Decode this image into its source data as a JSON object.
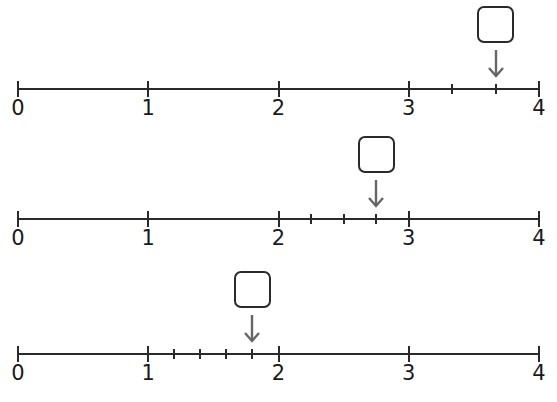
{
  "number_lines": [
    {
      "axis_y": 89,
      "range": [
        0,
        4
      ],
      "major_labels": [
        "0",
        "1",
        "2",
        "3",
        "4"
      ],
      "subdivided_interval": [
        3,
        4
      ],
      "subdivisions": 3,
      "arrow_value": 3.6667,
      "answer_box": ""
    },
    {
      "axis_y": 219,
      "range": [
        0,
        4
      ],
      "major_labels": [
        "0",
        "1",
        "2",
        "3",
        "4"
      ],
      "subdivided_interval": [
        2,
        3
      ],
      "subdivisions": 4,
      "arrow_value": 2.75,
      "answer_box": ""
    },
    {
      "axis_y": 354,
      "range": [
        0,
        4
      ],
      "major_labels": [
        "0",
        "1",
        "2",
        "3",
        "4"
      ],
      "subdivided_interval": [
        1,
        2
      ],
      "subdivisions": 5,
      "arrow_value": 1.8,
      "answer_box": ""
    }
  ],
  "colors": {
    "line": "#2a2a2a",
    "arrow": "#666666",
    "text": "#1a1a1a"
  }
}
